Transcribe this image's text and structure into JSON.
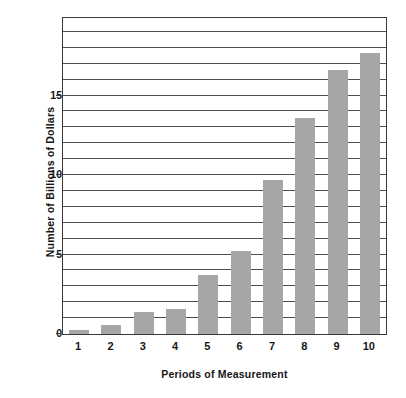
{
  "chart_data": {
    "type": "bar",
    "title": "",
    "subtitle": "",
    "xlabel": "Periods of Measurement",
    "ylabel": "Number of Billions of Dollars",
    "categories": [
      "1",
      "2",
      "3",
      "4",
      "5",
      "6",
      "7",
      "8",
      "9",
      "10"
    ],
    "values": [
      0.25,
      0.55,
      1.4,
      1.6,
      3.7,
      5.2,
      9.7,
      13.6,
      16.6,
      17.7
    ],
    "series": [
      {
        "name": "Number of Billions of Dollars",
        "values": [
          0.25,
          0.55,
          1.4,
          1.6,
          3.7,
          5.2,
          9.7,
          13.6,
          16.6,
          17.7
        ]
      }
    ],
    "ylim": [
      0,
      19.875
    ],
    "xlim": [
      0.5,
      10.5
    ],
    "y_tick_labels": [
      "0",
      "5",
      "10",
      "15"
    ],
    "y_tick_values": [
      0,
      5,
      10,
      15
    ],
    "gridline_values": [
      1,
      2,
      3,
      4,
      5,
      6,
      7,
      8,
      9,
      10,
      11,
      12,
      13,
      14,
      15,
      16,
      17,
      18,
      19
    ],
    "grid": true,
    "grid_axis": "y",
    "grid_interval": 1,
    "legend": null,
    "legend_position": "none",
    "bar_color": "#a6a6a6",
    "axis_color": "#3a3a3a",
    "grid_color": "#4d4d4d",
    "text_color": "#161616",
    "background_color": "#ffffff",
    "bar_width_fraction": 0.62,
    "annotations": []
  }
}
